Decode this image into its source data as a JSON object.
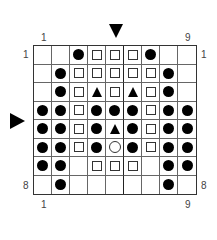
{
  "labels": {
    "top_left": "1",
    "top_right": "9",
    "bottom_left": "1",
    "bottom_right": "9",
    "row_top_left": "1",
    "row_top_right": "1",
    "row_bottom_left": "8",
    "row_bottom_right": "8"
  },
  "markers": {
    "column_marker": "down-arrow above column 5",
    "row_marker": "right-arrow beside row 4"
  },
  "legend_symbols": {
    "D": "filled-circle",
    "S": "open-square",
    "T": "filled-triangle",
    "O": "open-circle",
    ".": "empty"
  },
  "grid": {
    "columns": 9,
    "rows": 8,
    "cells": [
      [
        ".",
        ".",
        "D",
        "S",
        "S",
        "S",
        "D",
        ".",
        "."
      ],
      [
        ".",
        "D",
        "S",
        "S",
        "S",
        "S",
        "S",
        "D",
        "."
      ],
      [
        ".",
        "D",
        "S",
        "T",
        "S",
        "T",
        "S",
        "D",
        "."
      ],
      [
        "D",
        "D",
        "S",
        "D",
        "D",
        "D",
        "S",
        "D",
        "D"
      ],
      [
        "D",
        "D",
        "S",
        "D",
        "D",
        "D",
        "S",
        "D",
        "D"
      ],
      [
        "D",
        "D",
        "S",
        "D",
        "T",
        "D",
        "S",
        "D",
        "D"
      ],
      [
        "D",
        "D",
        "S",
        "D",
        "O",
        "D",
        "S",
        "D",
        "D"
      ],
      [
        "D",
        "D",
        ".",
        "S",
        "S",
        "S",
        ".",
        "D",
        "D"
      ],
      [
        ".",
        "D",
        ".",
        ".",
        ".",
        ".",
        ".",
        "D",
        "."
      ]
    ]
  }
}
